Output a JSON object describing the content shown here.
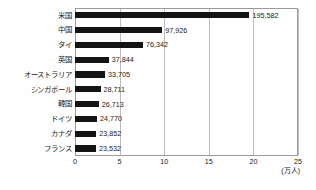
{
  "chart_data": {
    "type": "bar",
    "orientation": "horizontal",
    "title": "",
    "xlabel": "(万人)",
    "ylabel": "",
    "xlim": [
      0,
      25
    ],
    "xticks": [
      "0",
      "5",
      "10",
      "15",
      "20",
      "25"
    ],
    "xtick_values": [
      0,
      5,
      10,
      15,
      20,
      25
    ],
    "grid": true,
    "legend": "none",
    "unit_note": "(万人)",
    "unit_scale": 10000,
    "categories": [
      "米国",
      "中国",
      "タイ",
      "英国",
      "オーストラリア",
      "シンガポール",
      "韓国",
      "ドイツ",
      "カナダ",
      "フランス"
    ],
    "values": [
      195582,
      97926,
      76342,
      37844,
      33705,
      28711,
      26713,
      24770,
      23852,
      23532
    ],
    "value_labels": [
      "195,582",
      "97,926",
      "76,342",
      "37,844",
      "33,705",
      "28,711",
      "26,713",
      "24,770",
      "23,852",
      "23,532"
    ],
    "bar_color": "#141414",
    "frame_color": "#9a9a9a",
    "grid_color": "#bdbdbd"
  },
  "caption": ""
}
